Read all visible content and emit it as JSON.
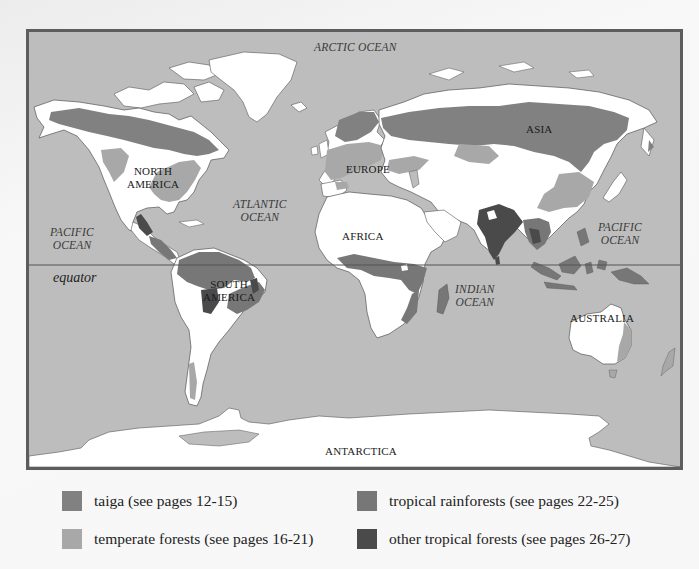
{
  "map": {
    "title": "World forest biomes",
    "equator_label": "equator",
    "colors": {
      "ocean": "#bdbdbd",
      "land": "#ffffff",
      "border": "#5d5d5d",
      "taiga": "#818181",
      "temperate_forests": "#a8a8a8",
      "tropical_rainforests": "#777777",
      "other_tropical_forests": "#4a4a4a"
    },
    "oceans": [
      {
        "id": "arctic",
        "label": "ARCTIC OCEAN"
      },
      {
        "id": "atlantic",
        "line1": "ATLANTIC",
        "line2": "OCEAN"
      },
      {
        "id": "pacific-west",
        "line1": "PACIFIC",
        "line2": "OCEAN"
      },
      {
        "id": "pacific-east",
        "line1": "PACIFIC",
        "line2": "OCEAN"
      },
      {
        "id": "indian",
        "line1": "INDIAN",
        "line2": "OCEAN"
      }
    ],
    "continents": [
      {
        "id": "north-america",
        "line1": "NORTH",
        "line2": "AMERICA"
      },
      {
        "id": "south-america",
        "line1": "SOUTH",
        "line2": "AMERICA"
      },
      {
        "id": "europe",
        "label": "EUROPE"
      },
      {
        "id": "asia",
        "label": "ASIA"
      },
      {
        "id": "africa",
        "label": "AFRICA"
      },
      {
        "id": "australia",
        "label": "AUSTRALIA"
      },
      {
        "id": "antarctica",
        "label": "ANTARCTICA"
      }
    ]
  },
  "legend": {
    "items": [
      {
        "id": "taiga",
        "label": "taiga (see pages 12-15)",
        "color": "#818181"
      },
      {
        "id": "temperate",
        "label": "temperate forests (see pages 16-21)",
        "color": "#a8a8a8"
      },
      {
        "id": "tropical-rainforest",
        "label": "tropical rainforests (see pages 22-25)",
        "color": "#777777"
      },
      {
        "id": "other-tropical",
        "label": "other tropical forests (see pages 26-27)",
        "color": "#4a4a4a"
      }
    ]
  }
}
